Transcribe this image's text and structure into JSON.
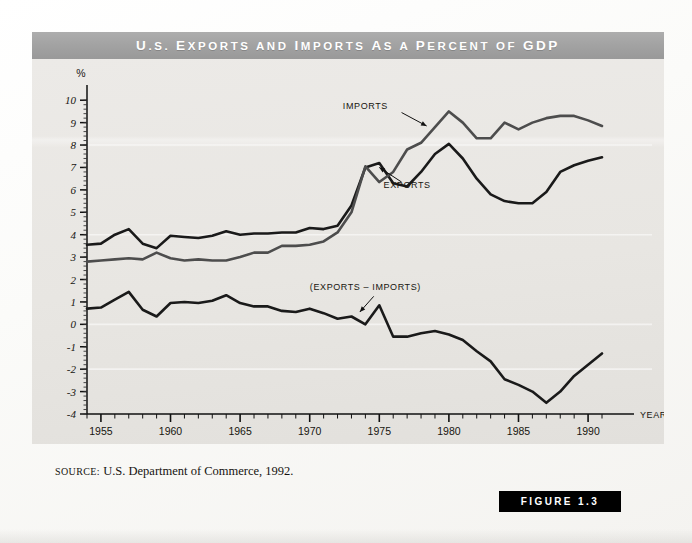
{
  "figure": {
    "title": "U.S. Exports and Imports As a Percent of GDP",
    "title_parts": [
      {
        "cap": "U",
        "rest": ".S. "
      },
      {
        "cap": "E",
        "rest": "xports "
      },
      {
        "cap": "",
        "rest": "and "
      },
      {
        "cap": "I",
        "rest": "mports "
      },
      {
        "cap": "A",
        "rest": "s "
      },
      {
        "cap": "",
        "rest": "a "
      },
      {
        "cap": "P",
        "rest": "ercent "
      },
      {
        "cap": "",
        "rest": "of "
      },
      {
        "cap": "GDP",
        "rest": ""
      }
    ],
    "badge_label": "FIGURE 1.3",
    "source_label": "SOURCE:",
    "source_text": "U.S. Department of Commerce, 1992."
  },
  "chart_data": {
    "type": "line",
    "title": "U.S. Exports and Imports As a Percent of GDP",
    "xlabel": "YEAR",
    "ylabel": "%",
    "xlim": [
      1954,
      1991
    ],
    "ylim": [
      -4,
      10.5
    ],
    "grid": false,
    "legend_position": "inline-annotations",
    "y_ticks": [
      -4,
      -3,
      -2,
      -1,
      0,
      1,
      2,
      3,
      4,
      5,
      6,
      7,
      8,
      9,
      10
    ],
    "y_tick_labels": [
      "-4",
      "-3",
      "-2",
      "-1",
      "0",
      "1",
      "2",
      "3",
      "4",
      "5",
      "6",
      "7",
      "8",
      "9",
      "10"
    ],
    "x_major_ticks": [
      1955,
      1960,
      1965,
      1970,
      1975,
      1980,
      1985,
      1990
    ],
    "x_major_tick_labels": [
      "1955",
      "1960",
      "1965",
      "1970",
      "1975",
      "1980",
      "1985",
      "1990"
    ],
    "x_minor_tick_step": 1,
    "annotations": [
      {
        "name": "imports-label",
        "text": "Imports",
        "x": 1974.0,
        "y": 9.6
      },
      {
        "name": "exports-label",
        "text": "Exports",
        "x": 1977.0,
        "y": 6.1
      },
      {
        "name": "difference-label",
        "text": "(Exports – Imports)",
        "x": 1974.0,
        "y": 1.55
      }
    ],
    "x": [
      1954,
      1955,
      1956,
      1957,
      1958,
      1959,
      1960,
      1961,
      1962,
      1963,
      1964,
      1965,
      1966,
      1967,
      1968,
      1969,
      1970,
      1971,
      1972,
      1973,
      1974,
      1975,
      1976,
      1977,
      1978,
      1979,
      1980,
      1981,
      1982,
      1983,
      1984,
      1985,
      1986,
      1987,
      1988,
      1989,
      1990,
      1991
    ],
    "series": [
      {
        "name": "Exports",
        "color": "#1a1a1a",
        "width": 2.6,
        "values": [
          3.55,
          3.6,
          4.0,
          4.25,
          3.6,
          3.4,
          3.95,
          3.9,
          3.85,
          3.95,
          4.15,
          4.0,
          4.05,
          4.05,
          4.1,
          4.1,
          4.3,
          4.25,
          4.4,
          5.3,
          7.0,
          7.2,
          6.3,
          6.15,
          6.8,
          7.6,
          8.05,
          7.4,
          6.5,
          5.8,
          5.5,
          5.4,
          5.4,
          5.9,
          6.8,
          7.1,
          7.3,
          7.45
        ]
      },
      {
        "name": "Imports",
        "color": "#4d4d4d",
        "width": 2.6,
        "values": [
          2.8,
          2.85,
          2.9,
          2.95,
          2.9,
          3.2,
          2.95,
          2.85,
          2.9,
          2.85,
          2.85,
          3.0,
          3.2,
          3.2,
          3.5,
          3.5,
          3.55,
          3.7,
          4.1,
          5.0,
          7.05,
          6.35,
          6.8,
          7.8,
          8.1,
          8.8,
          9.5,
          9.0,
          8.3,
          8.3,
          9.0,
          8.7,
          9.0,
          9.2,
          9.3,
          9.3,
          9.1,
          8.85
        ]
      },
      {
        "name": "(Exports – Imports)",
        "color": "#1a1a1a",
        "width": 2.6,
        "values": [
          0.7,
          0.75,
          1.1,
          1.45,
          0.65,
          0.35,
          0.95,
          1.0,
          0.95,
          1.05,
          1.3,
          0.95,
          0.8,
          0.8,
          0.6,
          0.55,
          0.7,
          0.5,
          0.25,
          0.35,
          0.0,
          0.85,
          -0.55,
          -0.55,
          -0.4,
          -0.3,
          -0.45,
          -0.7,
          -1.2,
          -1.65,
          -2.45,
          -2.7,
          -3.0,
          -3.5,
          -3.0,
          -2.3,
          -1.8,
          -1.3
        ]
      }
    ]
  }
}
